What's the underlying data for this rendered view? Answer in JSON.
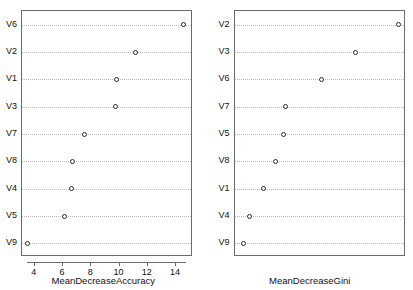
{
  "chart_data": [
    {
      "type": "scatter",
      "panel": "left",
      "title": "",
      "xlabel": "MeanDecreaseAccuracy",
      "ylabel": "",
      "categories": [
        "V6",
        "V2",
        "V1",
        "V3",
        "V7",
        "V8",
        "V4",
        "V5",
        "V9"
      ],
      "values": [
        14.5,
        11.1,
        9.8,
        9.75,
        7.5,
        6.7,
        6.6,
        6.1,
        3.5
      ],
      "xticks": [
        4,
        6,
        8,
        10,
        12,
        14
      ],
      "xlim": [
        3.1,
        15.2
      ],
      "grid": true,
      "legend": false,
      "marker": "open-circle"
    },
    {
      "type": "scatter",
      "panel": "right",
      "title": "",
      "xlabel": "MeanDecreaseGini",
      "ylabel": "",
      "categories": [
        "V2",
        "V3",
        "V6",
        "V7",
        "V5",
        "V8",
        "V1",
        "V4",
        "V9"
      ],
      "values": [
        93,
        68,
        48,
        27,
        25.5,
        21,
        14,
        6,
        2
      ],
      "xticks": [
        0,
        20,
        40,
        60,
        80
      ],
      "xlim": [
        -3,
        97
      ],
      "grid": true,
      "legend": false,
      "marker": "open-circle"
    }
  ],
  "panels": {
    "left": {
      "axis_title": "MeanDecreaseAccuracy",
      "ylabels": [
        "V6",
        "V2",
        "V1",
        "V3",
        "V7",
        "V8",
        "V4",
        "V5",
        "V9"
      ],
      "xticklabels": [
        "4",
        "6",
        "8",
        "10",
        "12",
        "14"
      ]
    },
    "right": {
      "axis_title": "MeanDecreaseGini",
      "ylabels": [
        "V2",
        "V3",
        "V6",
        "V7",
        "V5",
        "V8",
        "V1",
        "V4",
        "V9"
      ],
      "xticklabels": [
        "0",
        "20",
        "40",
        "60",
        "80"
      ]
    }
  },
  "style": {
    "point_color": "#2b2b2b",
    "grid_color": "#b9b9b9",
    "frame_color": "#6b6b6b",
    "background": "#ffffff"
  }
}
